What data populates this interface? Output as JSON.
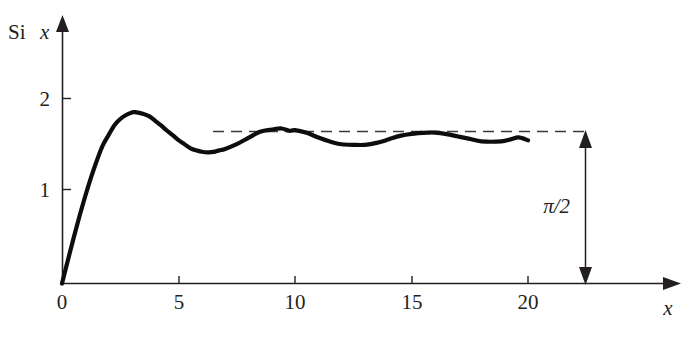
{
  "figure": {
    "background_color": "#ffffff",
    "curve_color": "#0d0d0d",
    "axis_color": "#231f20",
    "dash_color": "#3a3a3a"
  },
  "labels": {
    "y_axis_prefix": "Si",
    "y_axis_variable": "x",
    "x_axis_variable": "x",
    "annotation": "π/2"
  },
  "chart_data": {
    "type": "line",
    "title": "",
    "xlabel": "x",
    "ylabel": "Si x",
    "xlim": [
      0,
      22.8
    ],
    "ylim": [
      0,
      2.35
    ],
    "xticks": [
      0,
      5,
      10,
      15,
      20
    ],
    "xticklabels": [
      "0",
      "5",
      "10",
      "15",
      "20"
    ],
    "yticks": [
      1,
      2
    ],
    "yticklabels": [
      "1",
      "2"
    ],
    "grid": false,
    "legend": null,
    "annotations": [
      {
        "text": "π/2",
        "kind": "double-headed-arrow",
        "x": 22.0,
        "y_from": 0,
        "y_to": 1.5708,
        "label_x": 21.55,
        "label_y": 0.86
      },
      {
        "text": "",
        "kind": "dashed-asymptote",
        "y": 1.5708,
        "x_from": 6.45,
        "x_to": 22.0
      }
    ],
    "series": [
      {
        "name": "Si x",
        "x": [
          0.0,
          0.25,
          0.5,
          0.75,
          1.0,
          1.25,
          1.5,
          1.75,
          2.0,
          2.25,
          2.5,
          2.75,
          3.0,
          3.142,
          3.5,
          3.75,
          4.0,
          4.25,
          4.5,
          4.75,
          5.0,
          5.25,
          5.5,
          5.75,
          6.0,
          6.283,
          6.5,
          6.75,
          7.0,
          7.5,
          8.0,
          8.5,
          9.0,
          9.425,
          9.75,
          10.0,
          10.5,
          11.0,
          11.5,
          12.0,
          12.566,
          13.0,
          13.5,
          14.0,
          14.5,
          15.0,
          15.708,
          16.0,
          16.5,
          17.0,
          17.5,
          18.0,
          18.85,
          19.25,
          19.6,
          20.0
        ],
        "y": [
          0.0,
          0.2496,
          0.4931,
          0.7263,
          0.9461,
          1.1493,
          1.3325,
          1.4936,
          1.6054,
          1.7113,
          1.7785,
          1.8219,
          1.8487,
          1.8519,
          1.8331,
          1.8063,
          1.7582,
          1.7082,
          1.6541,
          1.6031,
          1.5499,
          1.5067,
          1.4646,
          1.4404,
          1.4247,
          1.4182,
          1.4224,
          1.4393,
          1.4546,
          1.5058,
          1.5742,
          1.6405,
          1.665,
          1.6758,
          1.651,
          1.6583,
          1.6284,
          1.5783,
          1.5351,
          1.505,
          1.4987,
          1.4994,
          1.52,
          1.5562,
          1.5957,
          1.6182,
          1.6313,
          1.6313,
          1.6156,
          1.5896,
          1.564,
          1.5366,
          1.5363,
          1.5577,
          1.5787,
          1.5482
        ]
      }
    ]
  }
}
